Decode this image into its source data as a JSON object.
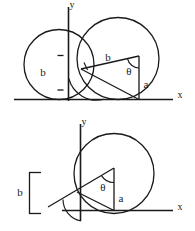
{
  "figure": {
    "panels": [
      {
        "name": "top-panel",
        "axes": {
          "x_label": "x",
          "y_label": "y"
        },
        "labels": {
          "radius_bracket": "b",
          "hypotenuse": "b",
          "angle": "θ",
          "opposite": "a"
        }
      },
      {
        "name": "bottom-panel",
        "axes": {
          "x_label": "x",
          "y_label": "y"
        },
        "labels": {
          "radius_bracket": "b",
          "angle": "θ",
          "opposite": "a"
        }
      }
    ]
  },
  "colors": {
    "stroke": "#1a1a1a",
    "background": "#ffffff"
  }
}
